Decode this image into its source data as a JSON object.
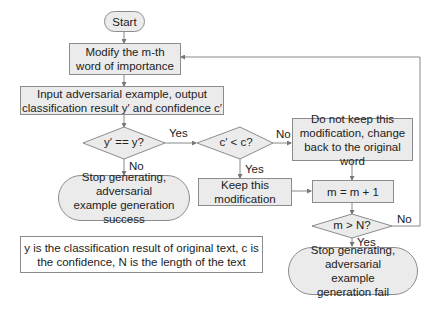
{
  "flowchart": {
    "start": "Start",
    "modify": "Modify the m-th word of importance",
    "input": "Input adversarial example, output classification result y′  and confidence c′",
    "decision1": "y′  == y?",
    "decision2": "c′  < c?",
    "success": "Stop generating, adversarial example generation success",
    "keep": "Keep this modification",
    "revert": "Do not keep this modification, change back to the original word",
    "increment": "m = m + 1",
    "decision3": "m >  N?",
    "fail": "Stop generating, adversarial example generation fail",
    "note": "y is the classification result of original text, c is the confidence, N is the length of the text",
    "labels": {
      "d1_yes": "Yes",
      "d1_no": "No",
      "d2_no": "No",
      "d2_yes": "Yes",
      "d3_no": "No",
      "d3_yes": "Yes"
    }
  }
}
